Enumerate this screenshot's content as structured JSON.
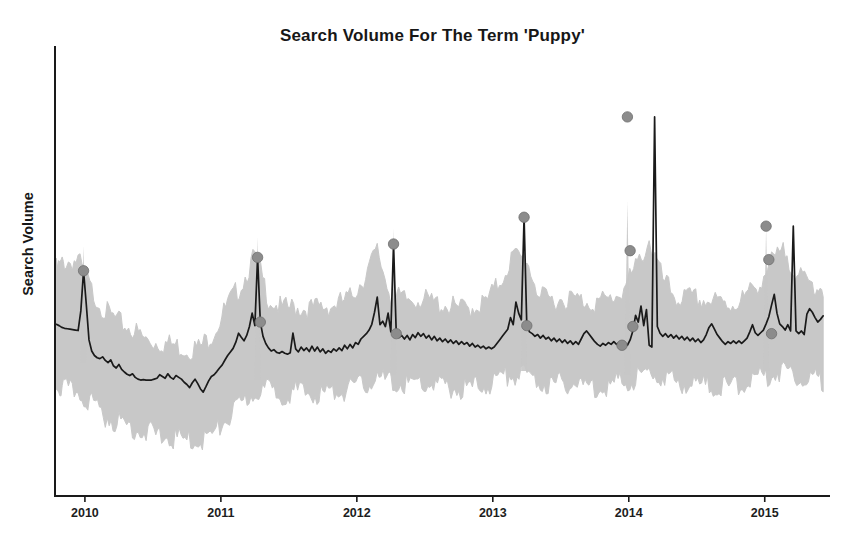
{
  "chart_data": {
    "type": "line",
    "title": "Search Volume For The Term 'Puppy'",
    "xlabel": "",
    "ylabel": "Search Volume",
    "grid": false,
    "legend": "none",
    "xlim": [
      2009.78,
      2015.48
    ],
    "ylim": [
      0,
      100
    ],
    "xtick_labels": [
      "2010",
      "2011",
      "2012",
      "2013",
      "2014",
      "2015"
    ],
    "xtick_values": [
      2010,
      2011,
      2012,
      2013,
      2014,
      2015
    ],
    "ytick_labels": [],
    "series": [
      {
        "name": "Search Volume",
        "type": "line",
        "color": "#1a1a1a",
        "x": [
          2009.79,
          2009.81,
          2009.83,
          2009.85,
          2009.87,
          2009.89,
          2009.91,
          2009.93,
          2009.95,
          2009.97,
          2009.99,
          2010.01,
          2010.03,
          2010.05,
          2010.07,
          2010.09,
          2010.11,
          2010.13,
          2010.15,
          2010.17,
          2010.19,
          2010.21,
          2010.23,
          2010.25,
          2010.27,
          2010.29,
          2010.31,
          2010.33,
          2010.35,
          2010.37,
          2010.39,
          2010.41,
          2010.43,
          2010.45,
          2010.47,
          2010.49,
          2010.51,
          2010.53,
          2010.55,
          2010.57,
          2010.59,
          2010.61,
          2010.63,
          2010.65,
          2010.67,
          2010.69,
          2010.71,
          2010.73,
          2010.75,
          2010.77,
          2010.79,
          2010.81,
          2010.83,
          2010.85,
          2010.87,
          2010.89,
          2010.91,
          2010.93,
          2010.95,
          2010.97,
          2010.99,
          2011.01,
          2011.03,
          2011.05,
          2011.07,
          2011.09,
          2011.11,
          2011.13,
          2011.15,
          2011.17,
          2011.19,
          2011.21,
          2011.23,
          2011.25,
          2011.27,
          2011.29,
          2011.31,
          2011.33,
          2011.35,
          2011.37,
          2011.39,
          2011.41,
          2011.43,
          2011.45,
          2011.47,
          2011.49,
          2011.51,
          2011.53,
          2011.55,
          2011.57,
          2011.59,
          2011.61,
          2011.63,
          2011.65,
          2011.67,
          2011.69,
          2011.71,
          2011.73,
          2011.75,
          2011.77,
          2011.79,
          2011.81,
          2011.83,
          2011.85,
          2011.87,
          2011.89,
          2011.91,
          2011.93,
          2011.95,
          2011.97,
          2011.99,
          2012.01,
          2012.03,
          2012.05,
          2012.07,
          2012.09,
          2012.11,
          2012.13,
          2012.15,
          2012.17,
          2012.19,
          2012.21,
          2012.23,
          2012.25,
          2012.27,
          2012.29,
          2012.31,
          2012.33,
          2012.35,
          2012.37,
          2012.39,
          2012.41,
          2012.43,
          2012.45,
          2012.47,
          2012.49,
          2012.51,
          2012.53,
          2012.55,
          2012.57,
          2012.59,
          2012.61,
          2012.63,
          2012.65,
          2012.67,
          2012.69,
          2012.71,
          2012.73,
          2012.75,
          2012.77,
          2012.79,
          2012.81,
          2012.83,
          2012.85,
          2012.87,
          2012.89,
          2012.91,
          2012.93,
          2012.95,
          2012.97,
          2012.99,
          2013.01,
          2013.03,
          2013.05,
          2013.07,
          2013.09,
          2013.11,
          2013.13,
          2013.15,
          2013.17,
          2013.19,
          2013.21,
          2013.23,
          2013.25,
          2013.27,
          2013.29,
          2013.31,
          2013.33,
          2013.35,
          2013.37,
          2013.39,
          2013.41,
          2013.43,
          2013.45,
          2013.47,
          2013.49,
          2013.51,
          2013.53,
          2013.55,
          2013.57,
          2013.59,
          2013.61,
          2013.63,
          2013.65,
          2013.67,
          2013.69,
          2013.71,
          2013.73,
          2013.75,
          2013.77,
          2013.79,
          2013.81,
          2013.83,
          2013.85,
          2013.87,
          2013.89,
          2013.91,
          2013.93,
          2013.95,
          2013.97,
          2013.99,
          2014.01,
          2014.03,
          2014.05,
          2014.07,
          2014.09,
          2014.11,
          2014.13,
          2014.15,
          2014.17,
          2014.19,
          2014.21,
          2014.23,
          2014.25,
          2014.27,
          2014.29,
          2014.31,
          2014.33,
          2014.35,
          2014.37,
          2014.39,
          2014.41,
          2014.43,
          2014.45,
          2014.47,
          2014.49,
          2014.51,
          2014.53,
          2014.55,
          2014.57,
          2014.59,
          2014.61,
          2014.63,
          2014.65,
          2014.67,
          2014.69,
          2014.71,
          2014.73,
          2014.75,
          2014.77,
          2014.79,
          2014.81,
          2014.83,
          2014.85,
          2014.87,
          2014.89,
          2014.91,
          2014.93,
          2014.95,
          2014.97,
          2014.99,
          2015.01,
          2015.03,
          2015.05,
          2015.07,
          2015.09,
          2015.11,
          2015.13,
          2015.15,
          2015.17,
          2015.19,
          2015.21,
          2015.23,
          2015.25,
          2015.27,
          2015.29,
          2015.31,
          2015.33,
          2015.35,
          2015.37,
          2015.39,
          2015.41,
          2015.43
        ],
        "y": [
          38.5,
          38.2,
          37.8,
          37.6,
          37.5,
          37.4,
          37.3,
          37.2,
          37.1,
          41.5,
          50.5,
          43.0,
          35.0,
          32.5,
          31.5,
          31.0,
          30.8,
          31.2,
          30.4,
          29.9,
          30.5,
          29.2,
          28.7,
          29.5,
          28.4,
          27.8,
          27.3,
          27.0,
          27.4,
          26.6,
          26.2,
          26.0,
          26.1,
          26.0,
          26.0,
          26.0,
          26.2,
          26.4,
          27.2,
          26.8,
          26.4,
          27.4,
          26.6,
          26.2,
          27.0,
          26.6,
          26.2,
          25.5,
          25.0,
          24.3,
          25.4,
          26.2,
          25.2,
          24.0,
          23.3,
          24.5,
          25.8,
          26.8,
          27.2,
          27.9,
          28.7,
          29.4,
          30.5,
          31.5,
          32.3,
          33.1,
          34.5,
          36.5,
          35.6,
          34.8,
          36.0,
          38.0,
          41.0,
          38.2,
          53.5,
          39.0,
          35.8,
          34.2,
          33.2,
          32.5,
          32.8,
          32.2,
          32.0,
          32.4,
          32.0,
          31.8,
          32.1,
          36.5,
          33.0,
          32.3,
          33.4,
          32.6,
          33.2,
          32.4,
          33.6,
          32.5,
          33.4,
          32.3,
          33.0,
          32.0,
          32.6,
          32.2,
          33.0,
          32.5,
          33.2,
          32.6,
          33.8,
          33.0,
          34.0,
          33.2,
          34.4,
          34.0,
          35.2,
          35.8,
          36.4,
          37.2,
          38.5,
          41.2,
          44.6,
          38.4,
          39.2,
          38.0,
          41.0,
          36.8,
          56.5,
          36.4,
          35.5,
          36.0,
          35.2,
          36.0,
          35.0,
          36.2,
          35.5,
          36.6,
          35.8,
          36.4,
          35.4,
          36.0,
          35.0,
          35.8,
          34.8,
          35.4,
          34.6,
          35.2,
          34.4,
          35.0,
          34.2,
          34.8,
          34.0,
          34.6,
          34.0,
          34.4,
          33.6,
          34.2,
          33.4,
          33.8,
          33.2,
          33.6,
          33.0,
          33.4,
          33.0,
          33.4,
          34.2,
          35.0,
          35.8,
          36.6,
          37.4,
          40.0,
          38.4,
          43.5,
          41.0,
          39.5,
          62.5,
          38.2,
          36.8,
          36.4,
          35.8,
          36.2,
          35.4,
          36.0,
          35.2,
          35.6,
          34.8,
          35.4,
          34.6,
          35.2,
          34.4,
          35.0,
          34.2,
          34.8,
          34.0,
          34.6,
          34.0,
          35.2,
          36.4,
          37.0,
          36.2,
          35.4,
          34.6,
          34.0,
          33.6,
          34.2,
          33.8,
          34.4,
          34.0,
          34.6,
          34.0,
          34.4,
          33.8,
          34.2,
          33.8,
          35.0,
          37.0,
          40.5,
          39.0,
          42.6,
          38.2,
          41.8,
          33.8,
          33.4,
          85.0,
          38.0,
          36.5,
          35.8,
          36.4,
          35.6,
          36.2,
          35.4,
          36.0,
          35.2,
          35.8,
          35.0,
          35.6,
          34.8,
          35.4,
          34.6,
          35.2,
          34.4,
          35.0,
          36.2,
          37.8,
          38.6,
          37.4,
          36.2,
          35.4,
          34.6,
          34.0,
          34.6,
          34.2,
          34.8,
          34.2,
          34.8,
          34.2,
          34.8,
          35.4,
          36.8,
          38.4,
          36.6,
          36.0,
          36.6,
          37.2,
          38.6,
          40.2,
          42.8,
          45.2,
          41.0,
          38.6,
          38.0,
          37.2,
          38.4,
          37.0,
          60.5,
          37.0,
          36.4,
          37.0,
          36.2,
          40.8,
          42.0,
          41.2,
          40.0,
          39.0,
          39.6,
          40.4
        ]
      },
      {
        "name": "Confidence Band",
        "type": "band",
        "color": "#c6c6c6",
        "x": [
          2009.79,
          2009.85,
          2009.95,
          2010.05,
          2010.15,
          2010.25,
          2010.35,
          2010.45,
          2010.55,
          2010.65,
          2010.75,
          2010.85,
          2010.95,
          2011.05,
          2011.15,
          2011.25,
          2011.35,
          2011.45,
          2011.55,
          2011.65,
          2011.75,
          2011.85,
          2011.95,
          2012.05,
          2012.15,
          2012.25,
          2012.35,
          2012.45,
          2012.55,
          2012.65,
          2012.75,
          2012.85,
          2012.95,
          2013.05,
          2013.15,
          2013.25,
          2013.35,
          2013.45,
          2013.55,
          2013.65,
          2013.75,
          2013.85,
          2013.95,
          2014.05,
          2014.15,
          2014.25,
          2014.35,
          2014.45,
          2014.55,
          2014.65,
          2014.75,
          2014.85,
          2014.95,
          2015.05,
          2015.15,
          2015.25,
          2015.35,
          2015.43
        ],
        "upper": [
          52.0,
          53.5,
          54.0,
          47.0,
          42.5,
          40.0,
          38.5,
          36.0,
          35.5,
          35.0,
          34.0,
          34.5,
          38.0,
          44.0,
          48.5,
          55.0,
          45.5,
          43.0,
          43.5,
          43.0,
          43.5,
          44.0,
          45.5,
          50.0,
          56.0,
          46.0,
          45.0,
          45.5,
          44.5,
          44.0,
          43.0,
          43.5,
          44.5,
          49.0,
          55.0,
          54.0,
          45.5,
          45.0,
          45.5,
          45.0,
          44.5,
          45.0,
          47.0,
          52.0,
          58.5,
          49.5,
          45.5,
          45.5,
          45.0,
          44.5,
          44.0,
          45.5,
          48.5,
          53.5,
          56.0,
          50.0,
          48.5,
          48.0
        ],
        "lower": [
          26.0,
          25.0,
          24.5,
          22.0,
          19.0,
          17.5,
          16.5,
          15.5,
          14.5,
          14.0,
          13.5,
          13.5,
          15.0,
          18.5,
          21.5,
          24.5,
          25.0,
          24.0,
          24.5,
          24.0,
          24.0,
          24.5,
          25.0,
          26.0,
          27.5,
          26.5,
          26.0,
          26.5,
          26.0,
          25.5,
          25.0,
          25.5,
          26.0,
          27.5,
          28.5,
          28.0,
          26.5,
          26.0,
          26.5,
          26.0,
          25.5,
          26.0,
          26.5,
          27.5,
          28.5,
          28.0,
          26.5,
          26.5,
          26.0,
          25.5,
          25.5,
          26.5,
          27.5,
          28.5,
          29.5,
          28.0,
          27.5,
          27.0
        ]
      }
    ],
    "markers": {
      "name": "Detected Peaks",
      "color": "#8c8c8c",
      "points": [
        {
          "x": 2009.99,
          "y": 50.5,
          "label": "2010 peak"
        },
        {
          "x": 2011.27,
          "y": 53.5,
          "label": "2011 peak"
        },
        {
          "x": 2011.29,
          "y": 39.0,
          "label": "2011 post-peak"
        },
        {
          "x": 2012.27,
          "y": 56.5,
          "label": "2012 peak"
        },
        {
          "x": 2012.29,
          "y": 36.4,
          "label": "2012 post-peak"
        },
        {
          "x": 2013.23,
          "y": 62.5,
          "label": "2013 peak"
        },
        {
          "x": 2013.25,
          "y": 38.2,
          "label": "2013 post-peak"
        },
        {
          "x": 2013.95,
          "y": 33.8,
          "label": "2014 pre-peak"
        },
        {
          "x": 2013.99,
          "y": 85.0,
          "label": "2014 peak"
        },
        {
          "x": 2014.01,
          "y": 55.0,
          "label": "2014 mid"
        },
        {
          "x": 2014.03,
          "y": 38.0,
          "label": "2014 post-peak"
        },
        {
          "x": 2015.01,
          "y": 60.5,
          "label": "2015 peak"
        },
        {
          "x": 2015.03,
          "y": 53.0,
          "label": "2015 mid"
        },
        {
          "x": 2015.05,
          "y": 36.4,
          "label": "2015 post-peak"
        }
      ]
    }
  }
}
